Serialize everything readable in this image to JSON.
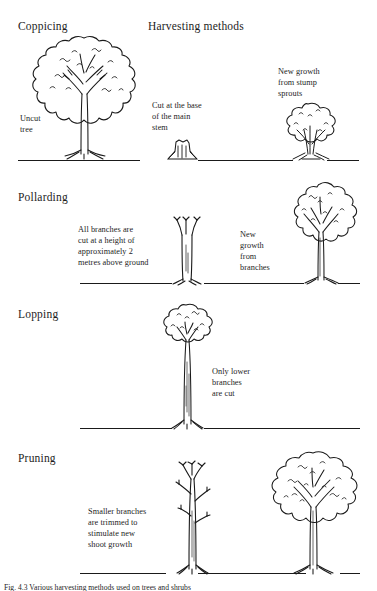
{
  "figure": {
    "heading": "Harvesting methods",
    "sections": [
      {
        "id": "coppicing",
        "title": "Coppicing",
        "notes": [
          {
            "id": "uncut-tree",
            "text": "Uncut\ntree"
          },
          {
            "id": "cut-at-base",
            "text": "Cut at the base\nof the main\nstem"
          },
          {
            "id": "new-growth-stump",
            "text": "New growth\nfrom stump\nsprouts"
          }
        ]
      },
      {
        "id": "pollarding",
        "title": "Pollarding",
        "notes": [
          {
            "id": "all-branches-cut",
            "text": "All branches are\ncut at a height of\napproximately 2\nmetres above ground"
          },
          {
            "id": "new-growth-branches",
            "text": "New\ngrowth\nfrom\nbranches"
          }
        ]
      },
      {
        "id": "lopping",
        "title": "Lopping",
        "notes": [
          {
            "id": "only-lower-branches",
            "text": "Only lower\nbranches\nare cut"
          }
        ]
      },
      {
        "id": "pruning",
        "title": "Pruning",
        "notes": [
          {
            "id": "smaller-branches",
            "text": "Smaller branches\nare trimmed to\nstimulate new\nshoot growth"
          }
        ]
      }
    ],
    "caption": "Fig. 4.3  Various harvesting methods used on trees and shrubs"
  },
  "colors": {
    "ink": "#1a1a1a",
    "paper": "#ffffff"
  }
}
